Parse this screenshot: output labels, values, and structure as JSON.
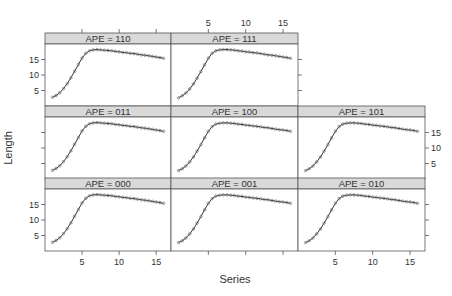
{
  "chart_data": {
    "type": "line",
    "layout": "lattice 3x3 trellis (7 panels)",
    "xlabel": "Series",
    "ylabel": "Length",
    "xlim": [
      0,
      17
    ],
    "ylim": [
      0,
      20
    ],
    "xticks": [
      5,
      10,
      15
    ],
    "yticks": [
      5,
      10,
      15
    ],
    "grid": false,
    "legend": null,
    "marker": "open circles with connecting line",
    "x": [
      1,
      1.5,
      2,
      2.5,
      3,
      3.5,
      4,
      4.5,
      5,
      5.5,
      6,
      6.5,
      7,
      7.5,
      8,
      8.5,
      9,
      9.5,
      10,
      10.5,
      11,
      11.5,
      12,
      12.5,
      13,
      13.5,
      14,
      14.5,
      15,
      15.5,
      16
    ],
    "panels": [
      {
        "strip": "APE = 110",
        "row": 0,
        "col": 0,
        "values": [
          2.8,
          3.4,
          4.3,
          5.6,
          7.2,
          9.1,
          11.2,
          13.4,
          15.5,
          17.0,
          17.8,
          18.1,
          18.2,
          18.1,
          18.0,
          17.9,
          17.8,
          17.6,
          17.5,
          17.3,
          17.2,
          17.0,
          16.9,
          16.7,
          16.5,
          16.4,
          16.2,
          16.0,
          15.8,
          15.6,
          15.4
        ]
      },
      {
        "strip": "APE = 111",
        "row": 0,
        "col": 1,
        "values": [
          2.6,
          3.3,
          4.2,
          5.5,
          7.1,
          9.0,
          11.1,
          13.3,
          15.4,
          17.0,
          17.8,
          18.1,
          18.2,
          18.2,
          18.1,
          18.0,
          17.8,
          17.7,
          17.5,
          17.4,
          17.2,
          17.1,
          16.9,
          16.7,
          16.5,
          16.4,
          16.2,
          16.0,
          15.8,
          15.6,
          15.4
        ]
      },
      {
        "strip": "APE = 011",
        "row": 1,
        "col": 0,
        "values": [
          2.8,
          3.4,
          4.3,
          5.6,
          7.2,
          9.1,
          11.2,
          13.4,
          15.5,
          17.0,
          17.8,
          18.1,
          18.2,
          18.1,
          18.0,
          17.9,
          17.8,
          17.6,
          17.5,
          17.3,
          17.2,
          17.0,
          16.9,
          16.7,
          16.5,
          16.4,
          16.2,
          16.0,
          15.8,
          15.6,
          15.4
        ]
      },
      {
        "strip": "APE = 100",
        "row": 1,
        "col": 1,
        "values": [
          2.7,
          3.3,
          4.2,
          5.5,
          7.1,
          9.0,
          11.1,
          13.3,
          15.4,
          16.9,
          17.7,
          18.0,
          18.1,
          18.1,
          18.0,
          17.9,
          17.7,
          17.6,
          17.4,
          17.3,
          17.1,
          17.0,
          16.8,
          16.6,
          16.5,
          16.3,
          16.1,
          15.9,
          15.8,
          15.6,
          15.4
        ]
      },
      {
        "strip": "APE = 101",
        "row": 1,
        "col": 2,
        "values": [
          2.7,
          3.3,
          4.2,
          5.5,
          7.1,
          9.0,
          11.1,
          13.3,
          15.4,
          16.9,
          17.7,
          18.0,
          18.1,
          18.1,
          18.0,
          17.9,
          17.7,
          17.6,
          17.4,
          17.3,
          17.1,
          17.0,
          16.8,
          16.6,
          16.5,
          16.3,
          16.1,
          15.9,
          15.8,
          15.6,
          15.4
        ]
      },
      {
        "strip": "APE = 000",
        "row": 2,
        "col": 0,
        "values": [
          2.8,
          3.4,
          4.3,
          5.6,
          7.2,
          9.1,
          11.2,
          13.4,
          15.5,
          17.0,
          17.8,
          18.1,
          18.2,
          18.1,
          18.0,
          17.9,
          17.8,
          17.6,
          17.5,
          17.3,
          17.2,
          17.0,
          16.9,
          16.7,
          16.5,
          16.4,
          16.2,
          16.0,
          15.8,
          15.6,
          15.4
        ]
      },
      {
        "strip": "APE = 001",
        "row": 2,
        "col": 1,
        "values": [
          2.7,
          3.3,
          4.2,
          5.5,
          7.1,
          9.0,
          11.1,
          13.3,
          15.4,
          16.9,
          17.7,
          18.0,
          18.1,
          18.1,
          18.0,
          17.9,
          17.7,
          17.6,
          17.4,
          17.3,
          17.1,
          17.0,
          16.8,
          16.6,
          16.5,
          16.3,
          16.1,
          15.9,
          15.8,
          15.6,
          15.4
        ]
      },
      {
        "strip": "APE = 010",
        "row": 2,
        "col": 2,
        "values": [
          2.7,
          3.3,
          4.2,
          5.5,
          7.1,
          9.0,
          11.1,
          13.3,
          15.4,
          16.9,
          17.7,
          18.0,
          18.1,
          18.1,
          18.0,
          17.9,
          17.7,
          17.6,
          17.4,
          17.3,
          17.1,
          17.0,
          16.8,
          16.6,
          16.5,
          16.3,
          16.1,
          15.9,
          15.8,
          15.6,
          15.4
        ]
      }
    ]
  },
  "colors": {
    "strip_fill": "#d9d9d9",
    "panel_border": "#555555",
    "series": "#333333",
    "text": "#333333"
  }
}
